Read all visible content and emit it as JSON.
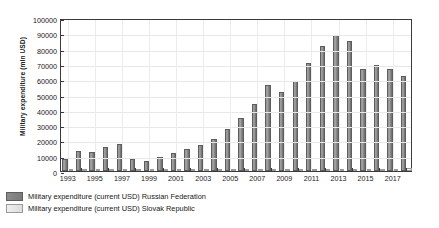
{
  "chart_data": {
    "type": "bar",
    "title": "",
    "xlabel": "",
    "ylabel": "Military expenditure (mln USD)",
    "ylim": [
      0,
      100000
    ],
    "ytick_labels": [
      "0",
      "10000",
      "20000",
      "30000",
      "40000",
      "50000",
      "60000",
      "70000",
      "80000",
      "90000",
      "100000"
    ],
    "ytick_values": [
      0,
      10000,
      20000,
      30000,
      40000,
      50000,
      60000,
      70000,
      80000,
      90000,
      100000
    ],
    "grid": true,
    "legend_position": "below-left",
    "categories": [
      "1993",
      "1994",
      "1995",
      "1996",
      "1997",
      "1998",
      "1999",
      "2000",
      "2001",
      "2002",
      "2003",
      "2004",
      "2005",
      "2006",
      "2007",
      "2008",
      "2009",
      "2010",
      "2011",
      "2012",
      "2013",
      "2014",
      "2015",
      "2016",
      "2017",
      "2018"
    ],
    "xtick_labels": [
      "1993",
      "1995",
      "1997",
      "1999",
      "2001",
      "2003",
      "2005",
      "2007",
      "2009",
      "2011",
      "2013",
      "2015",
      "2017"
    ],
    "series": [
      {
        "name": "Military expenditure (current USD) Russian Federation",
        "color": "#7b7b7b",
        "values": [
          7900,
          13400,
          12700,
          15700,
          17700,
          8000,
          6700,
          9400,
          12000,
          14100,
          17200,
          21100,
          27700,
          34700,
          43800,
          56300,
          51700,
          58900,
          70700,
          82000,
          88600,
          85000,
          66800,
          69600,
          66800,
          61800
        ]
      },
      {
        "name": "Military expenditure (current USD) Slovak Republic",
        "color": "#e2e2e2",
        "values": [
          380,
          420,
          400,
          430,
          430,
          400,
          370,
          380,
          400,
          430,
          580,
          720,
          900,
          1000,
          1200,
          1600,
          1500,
          1400,
          1300,
          1200,
          1000,
          1000,
          1000,
          1000,
          1200,
          1700
        ]
      }
    ]
  }
}
